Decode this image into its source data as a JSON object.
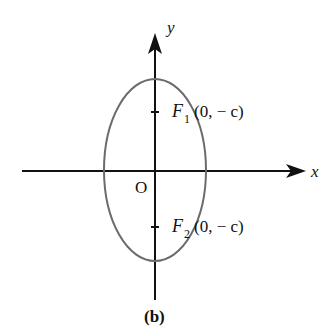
{
  "diagram": {
    "type": "ellipse-vertical-major-axis",
    "caption": "(b)",
    "axes": {
      "x_label": "x",
      "y_label": "y",
      "origin_label": "O"
    },
    "foci": [
      {
        "name": "F",
        "subscript": "1",
        "coords": "(0, − c)"
      },
      {
        "name": "F",
        "subscript": "2",
        "coords": "(0, − c)"
      }
    ],
    "colors": {
      "axes": "#111111",
      "ellipse": "#6b6b6b",
      "text": "#111111"
    }
  }
}
